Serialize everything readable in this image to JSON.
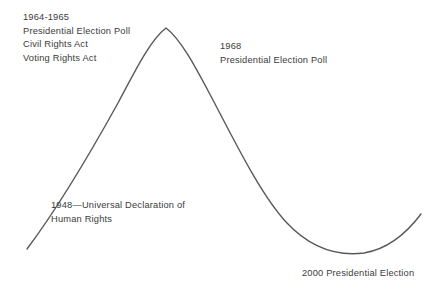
{
  "diagram": {
    "background_color": "#ffffff",
    "curve": {
      "name": "human-rights-progress-curve",
      "stroke_color": "#595959",
      "stroke_width": 1.4,
      "shape": "rise-peak-fall-trough-rise"
    },
    "annotations": [
      {
        "id": "ann-1964",
        "name": "annotation-1964-1965",
        "lines": [
          "1964-1965",
          "Presidential Election Poll",
          "Civil Rights Act",
          "Voting Rights Act"
        ]
      },
      {
        "id": "ann-1968",
        "name": "annotation-1968",
        "lines": [
          "1968",
          "Presidential Election Poll"
        ]
      },
      {
        "id": "ann-1948",
        "name": "annotation-1948",
        "lines": [
          "1948—Universal Declaration of",
          "Human Rights"
        ]
      },
      {
        "id": "ann-2000",
        "name": "annotation-2000",
        "lines": [
          "2000 Presidential Election"
        ]
      }
    ]
  }
}
